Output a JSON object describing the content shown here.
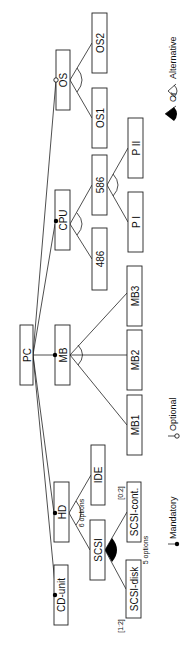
{
  "diagram": {
    "root": "PC",
    "nodes": {
      "PC": "PC",
      "CD": "CD-unit",
      "HD": "HD",
      "MB": "MB",
      "CPU": "CPU",
      "OS": "OS",
      "SCSI": "SCSI",
      "IDE": "IDE",
      "SCSIdisk": "SCSI-disk",
      "SCSIcont": "SCSI-cont.",
      "MB1": "MB1",
      "MB2": "MB2",
      "MB3": "MB3",
      "c486": "486",
      "c586": "586",
      "PI": "P I",
      "PII": "P II",
      "OS1": "OS1",
      "OS2": "OS2"
    },
    "annotations": {
      "hd_options": "6 options",
      "scsi_options": "5 options",
      "scsi_disk_card": "[1:2]",
      "scsi_cont_card": "[0:2]"
    },
    "legend": {
      "mandatory": "Mandatory",
      "optional": "Optional",
      "alternative": "Alternative",
      "or": "Or"
    }
  }
}
